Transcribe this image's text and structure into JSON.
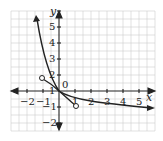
{
  "graph": {
    "x_axis_label": "x",
    "y_axis_label": "y",
    "origin_label": "0",
    "x_ticks": [
      {
        "value": -2,
        "label": "−2"
      },
      {
        "value": -1,
        "label": "−1"
      },
      {
        "value": 1,
        "label": "1"
      },
      {
        "value": 2,
        "label": "2"
      },
      {
        "value": 3,
        "label": "3"
      },
      {
        "value": 4,
        "label": "4"
      },
      {
        "value": 5,
        "label": "5"
      }
    ],
    "y_ticks": [
      {
        "value": 5,
        "label": "5"
      },
      {
        "value": 4,
        "label": "4"
      },
      {
        "value": 3,
        "label": "3"
      },
      {
        "value": 2,
        "label": "2"
      },
      {
        "value": 1,
        "label": "1"
      },
      {
        "value": -1,
        "label": "−1"
      },
      {
        "value": -2,
        "label": "−2"
      }
    ],
    "x_range": [
      -2.6,
      6.0
    ],
    "y_range": [
      -2.6,
      5.3
    ],
    "curves": [
      {
        "name": "decreasing-exponential-curve",
        "description": "curve from upper-left arrow through origin to lower-right arrow"
      },
      {
        "name": "segment-with-open-endpoints",
        "open_endpoints": [
          [
            -1,
            1
          ],
          [
            1,
            -1
          ]
        ]
      }
    ]
  }
}
